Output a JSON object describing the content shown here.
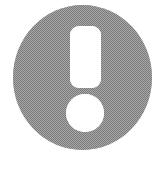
{
  "canvas": {
    "width": 167,
    "height": 178,
    "background_color": "#ffffff"
  },
  "icon": {
    "semantic_name": "exclamation-mark-icon",
    "description": "Exclamation point inside a filled gray circle",
    "alt_text": "Exclamation mark icon",
    "glyph": "!",
    "style": "dithered halftone grayscale, scanned artwork",
    "fill_color": "#8a8a8a",
    "dither_dark_color": "#6e6e6e",
    "dither_light_color": "#c2c2c2",
    "mark_color": "#ffffff",
    "disc": {
      "center_x": 82.5,
      "center_y": 77.5,
      "radius_x": 69.5,
      "radius_y": 72.5,
      "left": 13,
      "top": 5,
      "right": 152,
      "bottom": 150
    },
    "bar": {
      "x": 70,
      "y": 26,
      "width": 31,
      "height": 62,
      "corner_radius": 9
    },
    "dot": {
      "center_x": 85,
      "center_y": 113,
      "radius_x": 19,
      "radius_y": 19
    }
  }
}
